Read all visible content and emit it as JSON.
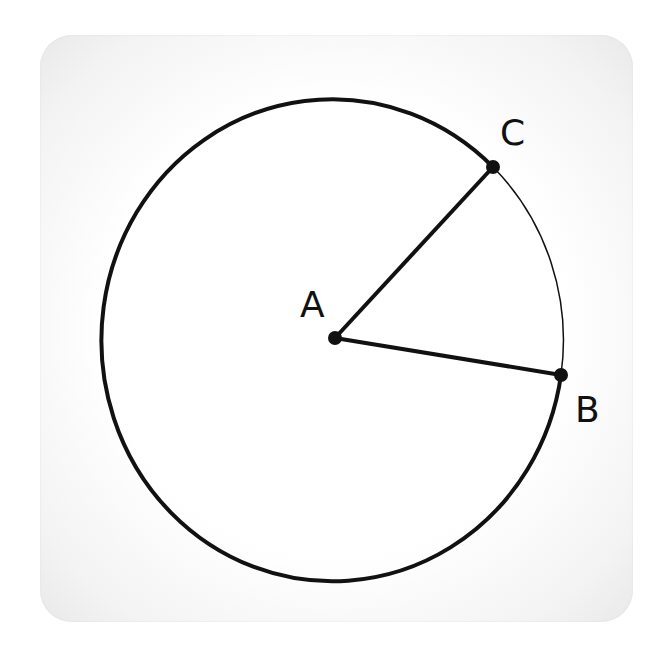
{
  "diagram": {
    "type": "circle-sector",
    "center": {
      "label": "A",
      "x": 335,
      "y": 338
    },
    "points": [
      {
        "label": "C",
        "x": 493,
        "y": 167,
        "label_x": 500,
        "label_y": 145
      },
      {
        "label": "B",
        "x": 561,
        "y": 375,
        "label_x": 575,
        "label_y": 420
      }
    ],
    "circle": {
      "cx": 335,
      "cy": 337,
      "rx": 231,
      "ry": 241
    },
    "labels": {
      "A": "A",
      "B": "B",
      "C": "C"
    },
    "colors": {
      "stroke": "#111111",
      "background": "#ffffff",
      "card_edge": "#e6e6e6"
    }
  }
}
